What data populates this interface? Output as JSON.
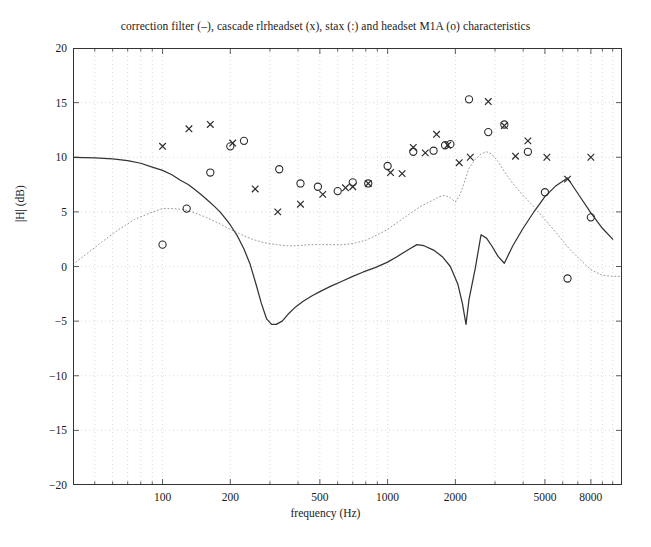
{
  "chart_data": {
    "type": "line",
    "title": "correction filter (–), cascade rlrheadset (x), stax (:) and headset M1A (o) characteristics",
    "xlabel": "frequency (Hz)",
    "ylabel": "|H| (dB)",
    "xscale": "log",
    "xlim": [
      40,
      11000
    ],
    "ylim": [
      -20,
      20
    ],
    "yticks": [
      -20,
      -15,
      -10,
      -5,
      0,
      5,
      10,
      15,
      20
    ],
    "xticks": [
      100,
      200,
      500,
      1000,
      2000,
      5000,
      8000
    ],
    "xtick_labels": [
      "100",
      "200",
      "500",
      "1000",
      "2000",
      "5000",
      "8000"
    ],
    "grid": true,
    "legend_position": "in-title",
    "series": [
      {
        "name": "correction filter",
        "marker": "none",
        "style": "solid",
        "color": "#333333",
        "points": [
          [
            40,
            10.0
          ],
          [
            50,
            9.95
          ],
          [
            60,
            9.85
          ],
          [
            70,
            9.7
          ],
          [
            80,
            9.45
          ],
          [
            90,
            9.1
          ],
          [
            100,
            8.8
          ],
          [
            110,
            8.4
          ],
          [
            120,
            7.9
          ],
          [
            130,
            7.5
          ],
          [
            140,
            7.0
          ],
          [
            150,
            6.5
          ],
          [
            160,
            6.0
          ],
          [
            170,
            5.5
          ],
          [
            180,
            5.0
          ],
          [
            190,
            4.4
          ],
          [
            200,
            3.8
          ],
          [
            215,
            2.8
          ],
          [
            230,
            1.6
          ],
          [
            245,
            0.2
          ],
          [
            260,
            -1.6
          ],
          [
            275,
            -3.4
          ],
          [
            290,
            -4.8
          ],
          [
            305,
            -5.3
          ],
          [
            320,
            -5.3
          ],
          [
            340,
            -5.0
          ],
          [
            360,
            -4.4
          ],
          [
            390,
            -3.7
          ],
          [
            420,
            -3.2
          ],
          [
            460,
            -2.7
          ],
          [
            500,
            -2.3
          ],
          [
            560,
            -1.8
          ],
          [
            620,
            -1.4
          ],
          [
            700,
            -0.9
          ],
          [
            780,
            -0.5
          ],
          [
            880,
            -0.1
          ],
          [
            1000,
            0.4
          ],
          [
            1100,
            0.9
          ],
          [
            1250,
            1.6
          ],
          [
            1350,
            2.0
          ],
          [
            1450,
            1.9
          ],
          [
            1600,
            1.5
          ],
          [
            1750,
            0.9
          ],
          [
            1900,
            0.0
          ],
          [
            2050,
            -1.6
          ],
          [
            2150,
            -3.4
          ],
          [
            2230,
            -5.3
          ],
          [
            2300,
            -3.0
          ],
          [
            2450,
            -0.2
          ],
          [
            2600,
            2.9
          ],
          [
            2750,
            2.6
          ],
          [
            2900,
            1.9
          ],
          [
            3100,
            0.9
          ],
          [
            3300,
            0.3
          ],
          [
            3600,
            1.9
          ],
          [
            4000,
            3.5
          ],
          [
            4500,
            5.1
          ],
          [
            5000,
            6.4
          ],
          [
            5600,
            7.4
          ],
          [
            6300,
            8.1
          ],
          [
            7100,
            6.5
          ],
          [
            8000,
            4.9
          ],
          [
            9000,
            3.5
          ],
          [
            10000,
            2.5
          ]
        ]
      },
      {
        "name": "stax",
        "marker": "none",
        "style": "dotted",
        "color": "#9a9a9a",
        "points": [
          [
            40,
            0.2
          ],
          [
            47,
            1.3
          ],
          [
            55,
            2.4
          ],
          [
            64,
            3.4
          ],
          [
            75,
            4.3
          ],
          [
            88,
            4.9
          ],
          [
            100,
            5.3
          ],
          [
            112,
            5.3
          ],
          [
            125,
            5.2
          ],
          [
            140,
            4.9
          ],
          [
            160,
            4.4
          ],
          [
            180,
            3.9
          ],
          [
            200,
            3.4
          ],
          [
            225,
            2.9
          ],
          [
            250,
            2.5
          ],
          [
            280,
            2.2
          ],
          [
            320,
            2.0
          ],
          [
            360,
            1.9
          ],
          [
            400,
            1.9
          ],
          [
            450,
            2.0
          ],
          [
            500,
            2.0
          ],
          [
            560,
            2.0
          ],
          [
            630,
            2.0
          ],
          [
            700,
            2.1
          ],
          [
            800,
            2.4
          ],
          [
            900,
            2.9
          ],
          [
            1000,
            3.4
          ],
          [
            1100,
            4.0
          ],
          [
            1250,
            4.8
          ],
          [
            1400,
            5.5
          ],
          [
            1600,
            6.1
          ],
          [
            1700,
            6.4
          ],
          [
            1800,
            6.5
          ],
          [
            1900,
            6.3
          ],
          [
            2000,
            5.9
          ],
          [
            2100,
            6.6
          ],
          [
            2200,
            7.8
          ],
          [
            2300,
            9.0
          ],
          [
            2450,
            9.8
          ],
          [
            2600,
            10.3
          ],
          [
            2750,
            10.5
          ],
          [
            2900,
            10.3
          ],
          [
            3100,
            9.6
          ],
          [
            3300,
            8.7
          ],
          [
            3600,
            7.6
          ],
          [
            4000,
            6.5
          ],
          [
            4500,
            5.4
          ],
          [
            5000,
            4.3
          ],
          [
            5600,
            3.1
          ],
          [
            6300,
            1.8
          ],
          [
            7100,
            0.7
          ],
          [
            8000,
            -0.3
          ],
          [
            9000,
            -0.8
          ],
          [
            10000,
            -0.9
          ],
          [
            11000,
            -0.9
          ]
        ]
      },
      {
        "name": "cascade rlrheadset",
        "marker": "x",
        "style": "markers",
        "color": "#2b2b2b",
        "points": [
          [
            100,
            11.0
          ],
          [
            131,
            12.6
          ],
          [
            163,
            13.0
          ],
          [
            205,
            11.3
          ],
          [
            258,
            7.1
          ],
          [
            325,
            5.0
          ],
          [
            410,
            5.7
          ],
          [
            515,
            6.6
          ],
          [
            650,
            7.2
          ],
          [
            700,
            7.3
          ],
          [
            820,
            7.6
          ],
          [
            1030,
            8.6
          ],
          [
            1160,
            8.5
          ],
          [
            1300,
            10.9
          ],
          [
            1470,
            10.4
          ],
          [
            1650,
            12.1
          ],
          [
            1850,
            11.1
          ],
          [
            2080,
            9.5
          ],
          [
            2330,
            10.0
          ],
          [
            2800,
            15.1
          ],
          [
            3300,
            12.9
          ],
          [
            3700,
            10.1
          ],
          [
            4200,
            11.5
          ],
          [
            5100,
            10.0
          ],
          [
            6300,
            8.0
          ],
          [
            8000,
            10.0
          ]
        ]
      },
      {
        "name": "headset M1A",
        "marker": "o",
        "style": "markers",
        "color": "#2b2b2b",
        "points": [
          [
            100,
            2.0
          ],
          [
            128,
            5.3
          ],
          [
            163,
            8.6
          ],
          [
            200,
            11.0
          ],
          [
            230,
            11.5
          ],
          [
            330,
            8.9
          ],
          [
            410,
            7.6
          ],
          [
            490,
            7.3
          ],
          [
            600,
            6.9
          ],
          [
            700,
            7.7
          ],
          [
            820,
            7.6
          ],
          [
            1000,
            9.2
          ],
          [
            1300,
            10.5
          ],
          [
            1600,
            10.6
          ],
          [
            1800,
            11.1
          ],
          [
            1900,
            11.2
          ],
          [
            2300,
            15.3
          ],
          [
            2800,
            12.3
          ],
          [
            3300,
            13.0
          ],
          [
            4200,
            10.5
          ],
          [
            5000,
            6.8
          ],
          [
            6300,
            -1.1
          ],
          [
            8000,
            4.5
          ]
        ]
      }
    ]
  }
}
